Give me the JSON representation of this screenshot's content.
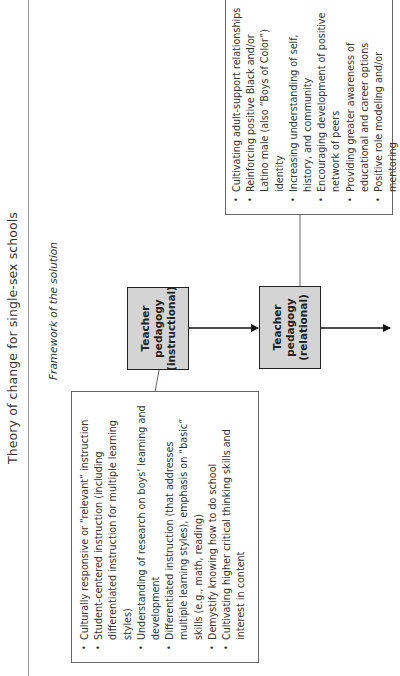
{
  "header": {
    "title": "Theory of change for single-sex schools",
    "subtitle": "Framework of the solution"
  },
  "instructional_box": {
    "label_lines": [
      "Teacher",
      "pedagogy",
      "(instructional)"
    ],
    "items": [
      "Culturally responsive or “relevant” instruction",
      "Student-centered instruction (including differentiated instruction for multiple learning styles)",
      "Understanding of research on boys’ learning and development",
      "Differentiated instruction (that addresses multiple learning styles), emphasis on “basic” skills (e.g., math, reading)",
      "Demystify knowing how to do school",
      "Cultivating higher critical thinking skills and interest in content"
    ]
  },
  "relational_box": {
    "label_lines": [
      "Teacher",
      "pedagogy",
      "(relational)"
    ],
    "items": [
      "Cultivating adult-support relationships",
      "Reinforcing positive Black and/or Latino male (also “Boys of Color”) identity",
      "Increasing understanding of self, history, and community",
      "Encouraging development of positive network of peers",
      "Providing greater awareness of educational and career options",
      "Positive role modeling and/or mentoring"
    ]
  },
  "colors": {
    "node_fill": "#d4d4d4",
    "node_border": "#222222",
    "rule": "#999999",
    "text": "#333333"
  }
}
